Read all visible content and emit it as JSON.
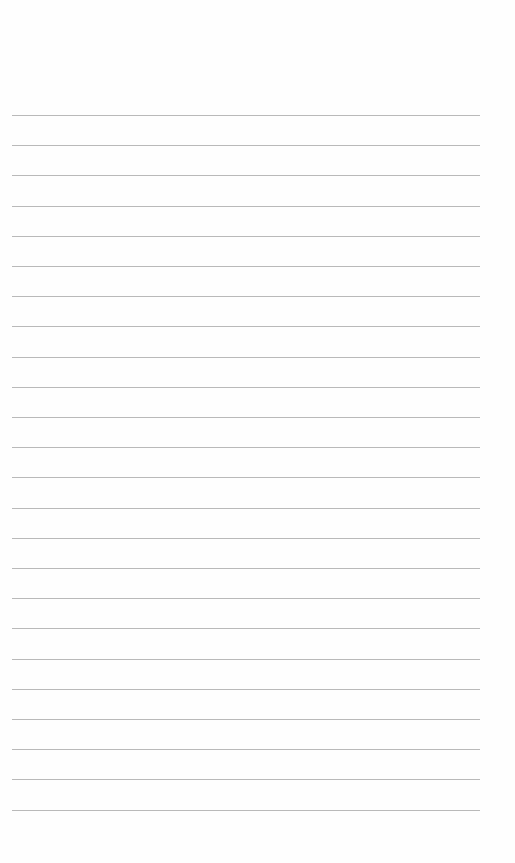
{
  "page": {
    "type": "blank-lined-sheet",
    "line_count": 24,
    "line_color": "#b9b9b9",
    "background_color": "#ffffff"
  },
  "lines": [
    "",
    "",
    "",
    "",
    "",
    "",
    "",
    "",
    "",
    "",
    "",
    "",
    "",
    "",
    "",
    "",
    "",
    "",
    "",
    "",
    "",
    "",
    "",
    ""
  ]
}
